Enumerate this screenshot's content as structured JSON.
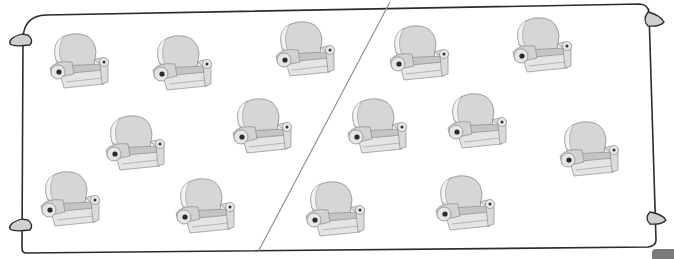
{
  "scene": {
    "description": "Worksheet illustration: a rectangular frame containing armchairs divided by a diagonal line",
    "divider": {
      "from": [
        390,
        2
      ],
      "to": [
        258,
        252
      ]
    },
    "colors": {
      "frame": "#2b2b2b",
      "divider": "#888888",
      "chair_fill": "#d6d6d6",
      "chair_shade": "#a8a8a8",
      "corner_tab": "#7a7a7a"
    },
    "left_group": {
      "count": 7,
      "chairs": [
        {
          "x": 42,
          "y": 30
        },
        {
          "x": 145,
          "y": 32
        },
        {
          "x": 268,
          "y": 18
        },
        {
          "x": 98,
          "y": 112
        },
        {
          "x": 225,
          "y": 95
        },
        {
          "x": 33,
          "y": 168
        },
        {
          "x": 168,
          "y": 175
        }
      ]
    },
    "right_group": {
      "count": 7,
      "chairs": [
        {
          "x": 382,
          "y": 22
        },
        {
          "x": 505,
          "y": 14
        },
        {
          "x": 340,
          "y": 95
        },
        {
          "x": 440,
          "y": 90
        },
        {
          "x": 552,
          "y": 118
        },
        {
          "x": 298,
          "y": 178
        },
        {
          "x": 428,
          "y": 172
        }
      ]
    },
    "total_chairs": 14
  }
}
